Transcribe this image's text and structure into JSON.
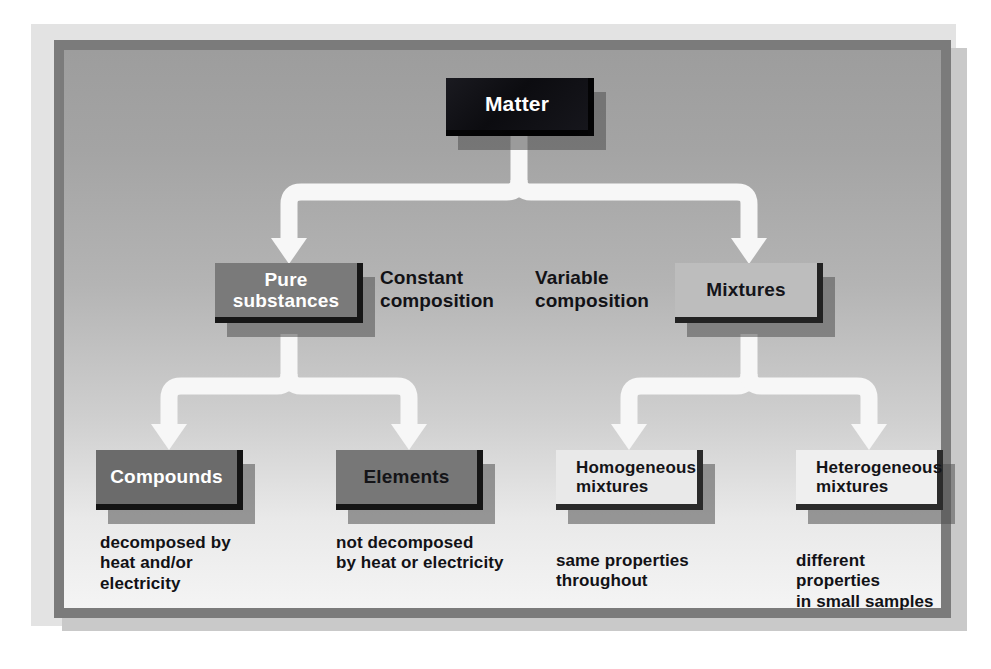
{
  "diagram": {
    "type": "classification-tree",
    "root": {
      "id": "matter",
      "label": "Matter"
    },
    "level2": [
      {
        "id": "pure-substances",
        "label": "Pure\nsubstances",
        "line1": "Pure",
        "line2": "substances"
      },
      {
        "id": "mixtures",
        "label": "Mixtures",
        "line1": "Mixtures",
        "line2": ""
      }
    ],
    "level2_annotations": [
      {
        "id": "constant-composition",
        "line1": "Constant",
        "line2": "composition"
      },
      {
        "id": "variable-composition",
        "line1": "Variable",
        "line2": "composition"
      }
    ],
    "level3": [
      {
        "id": "compounds",
        "line1": "Compounds",
        "line2": ""
      },
      {
        "id": "elements",
        "line1": "Elements",
        "line2": ""
      },
      {
        "id": "homogeneous-mixtures",
        "line1": "Homogeneous",
        "line2": "mixtures"
      },
      {
        "id": "heterogeneous-mixtures",
        "line1": "Heterogeneous",
        "line2": "mixtures"
      }
    ],
    "level3_captions": [
      {
        "id": "compounds-caption",
        "line1": "decomposed by",
        "line2": "heat and/or",
        "line3": "electricity"
      },
      {
        "id": "elements-caption",
        "line1": "not decomposed",
        "line2": "by heat or electricity",
        "line3": ""
      },
      {
        "id": "homogeneous-caption",
        "line1": "same properties",
        "line2": "throughout",
        "line3": ""
      },
      {
        "id": "heterogeneous-caption",
        "line1": "different properties",
        "line2": "in small samples",
        "line3": ""
      }
    ],
    "colors": {
      "page_background": "#ffffff",
      "mat": "#e3e3e3",
      "panel_border": "#7b7b7b",
      "panel_top": "#9d9d9d",
      "panel_bottom": "#f4f4f4",
      "connector": "#f7f7f7",
      "matter_box": "#101014",
      "pure_box": "#7a7a7a",
      "mixtures_box": "#bdbdbd",
      "compounds_box": "#6b6b6b",
      "elements_box": "#777777",
      "homogeneous_box": "#e9e9e9",
      "heterogeneous_box": "#efefef",
      "text_dark": "#121216",
      "text_light": "#ffffff"
    }
  }
}
